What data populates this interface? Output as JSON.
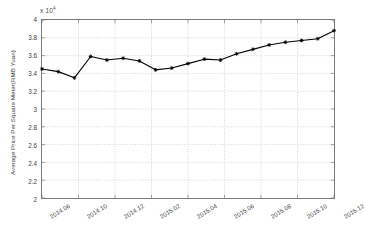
{
  "chart_data": {
    "type": "line",
    "title": "",
    "subtitle": "",
    "xlabel": "",
    "ylabel": "Average Price Per Square Meter(RMB Yuan)",
    "y_exponent_label": "x 10",
    "y_exponent_power": "4",
    "y_multiplier": 10000,
    "ylim": [
      2,
      4
    ],
    "ytick_labels": [
      "4",
      "3.8",
      "3.6",
      "3.4",
      "3.2",
      "3",
      "2.8",
      "2.6",
      "2.4",
      "2.2",
      "2"
    ],
    "ytick_values": [
      4,
      3.8,
      3.6,
      3.4,
      3.2,
      3,
      2.8,
      2.6,
      2.4,
      2.2,
      2
    ],
    "xtick_labels": [
      "2014.06",
      "2014.10",
      "2014.12",
      "2015.02",
      "2015.04",
      "2015.06",
      "2015.08",
      "2015.10",
      "2015.12"
    ],
    "grid": true,
    "grid_style": "dotted",
    "legend": "none",
    "marker": "star",
    "line_color": "#000000",
    "series": [
      {
        "name": "Average Price Per Square Meter",
        "categories": [
          "2014.06",
          "2014.07",
          "2014.08",
          "2014.09",
          "2014.10",
          "2014.11",
          "2014.12",
          "2015.01",
          "2015.02",
          "2015.03",
          "2015.04",
          "2015.05",
          "2015.06",
          "2015.07",
          "2015.08",
          "2015.09",
          "2015.10",
          "2015.11",
          "2015.12"
        ],
        "values": [
          3.45,
          3.42,
          3.35,
          3.59,
          3.55,
          3.57,
          3.54,
          3.44,
          3.46,
          3.51,
          3.56,
          3.55,
          3.62,
          3.67,
          3.72,
          3.75,
          3.77,
          3.79,
          3.88
        ]
      }
    ]
  }
}
